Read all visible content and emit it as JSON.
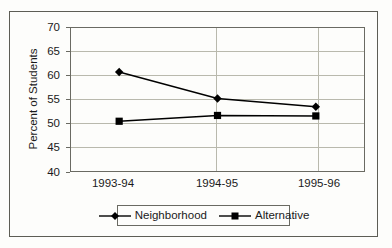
{
  "chart_data": {
    "type": "line",
    "title": "",
    "subtitle": "",
    "xlabel": "",
    "ylabel": "Percent of Students",
    "categories": [
      "1993-94",
      "1994-95",
      "1995-96"
    ],
    "ylim": [
      40,
      70
    ],
    "yticks": [
      40,
      45,
      50,
      55,
      60,
      65,
      70
    ],
    "ytick_labels": [
      "40",
      "45",
      "50",
      "55",
      "60",
      "65",
      "70"
    ],
    "grid": "horizontal-and-category-verticals",
    "legend_position": "bottom-center",
    "series": [
      {
        "name": "Neighborhood",
        "marker": "diamond",
        "color": "#000000",
        "values": [
          60.7,
          55.2,
          53.5
        ]
      },
      {
        "name": "Alternative",
        "marker": "square",
        "color": "#000000",
        "values": [
          50.5,
          51.7,
          51.6
        ]
      }
    ]
  },
  "legend": {
    "entries": [
      {
        "label": "Neighborhood",
        "marker": "diamond-marker-icon"
      },
      {
        "label": "Alternative",
        "marker": "square-marker-icon"
      }
    ]
  },
  "colors": {
    "frame": "#5d5d55",
    "axis": "#6a6a62",
    "gridline": "#b9b9ad",
    "series": "#000000",
    "background": "#fdfdfb",
    "text": "#1a1a1a"
  }
}
